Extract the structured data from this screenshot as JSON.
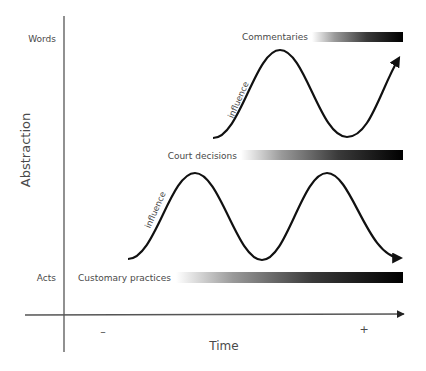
{
  "diagram": {
    "type": "conceptual-axis-diagram",
    "axes": {
      "y_label": "Abstraction",
      "y_ticks": {
        "top": "Words",
        "bottom": "Acts"
      },
      "x_label": "Time",
      "x_ticks": {
        "left": "–",
        "right": "+"
      }
    },
    "layers": [
      {
        "label": "Commentaries",
        "level": "top"
      },
      {
        "label": "Court decisions",
        "level": "middle"
      },
      {
        "label": "Customary practices",
        "level": "bottom"
      }
    ],
    "waves": [
      {
        "label": "influence",
        "between": [
          "Court decisions",
          "Commentaries"
        ]
      },
      {
        "label": "influence",
        "between": [
          "Customary practices",
          "Court decisions"
        ]
      }
    ],
    "colors": {
      "axis": "#555555",
      "curve": "#111111",
      "gradient_start": "#ffffff",
      "gradient_end": "#000000"
    }
  }
}
